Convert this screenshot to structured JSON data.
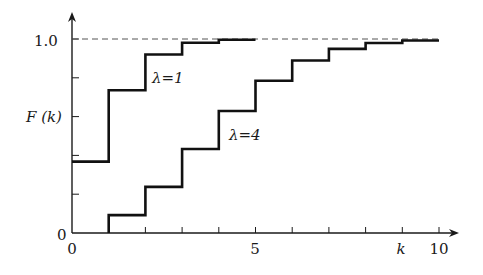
{
  "chart_data": {
    "type": "line",
    "subtype": "step",
    "title": "",
    "xlabel": "k",
    "ylabel": "F (k)",
    "xlim": [
      0,
      10
    ],
    "ylim": [
      0,
      1.0
    ],
    "x_ticks": [
      0,
      1,
      2,
      3,
      4,
      5,
      6,
      7,
      8,
      9,
      10
    ],
    "x_tick_labels": [
      {
        "value": 0,
        "label": "0"
      },
      {
        "value": 5,
        "label": "5"
      },
      {
        "value": 10,
        "label": "10"
      }
    ],
    "y_ticks": [
      0,
      0.2,
      0.4,
      0.6,
      0.8,
      1.0
    ],
    "y_tick_labels": [
      {
        "value": 0,
        "label": "0"
      },
      {
        "value": 1.0,
        "label": "1.0"
      }
    ],
    "reference_line": {
      "y": 1.0,
      "style": "dashed"
    },
    "series": [
      {
        "name": "λ=1",
        "x": [
          0,
          1,
          2,
          3,
          4,
          5
        ],
        "values": [
          0.368,
          0.736,
          0.92,
          0.981,
          0.996,
          0.996
        ]
      },
      {
        "name": "λ=4",
        "x": [
          1,
          2,
          3,
          4,
          5,
          6,
          7,
          8,
          9,
          10
        ],
        "values": [
          0.092,
          0.238,
          0.433,
          0.629,
          0.785,
          0.889,
          0.949,
          0.979,
          0.992,
          0.992
        ]
      }
    ],
    "annotations": [
      {
        "text": "λ=1",
        "x": 2.2,
        "y": 0.8
      },
      {
        "text": "λ=4",
        "x": 4.2,
        "y": 0.51
      }
    ],
    "grid": false,
    "legend": "none"
  },
  "labels": {
    "y_axis": "F (k)",
    "x_axis": "k",
    "y_one": "1.0",
    "y_zero": "0",
    "x_zero": "0",
    "x_five": "5",
    "x_ten": "10",
    "series_1": "λ=1",
    "series_2": "λ=4"
  }
}
